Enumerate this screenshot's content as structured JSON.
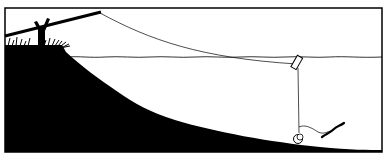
{
  "illustration": {
    "subject": "fishing setup cross-section",
    "elements": [
      "bank",
      "grass",
      "rod-rest",
      "fishing-rod",
      "fishing-line",
      "water-surface",
      "float",
      "sinker",
      "bait-worm"
    ],
    "colors": {
      "ink": "#000000",
      "paper": "#ffffff"
    }
  }
}
